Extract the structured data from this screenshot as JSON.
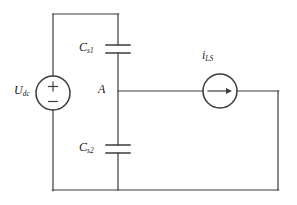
{
  "diagram": {
    "type": "electrical-schematic",
    "stroke_color": "#3b3b3b",
    "text_color": "#1a1a1a",
    "background_color": "#ffffff"
  },
  "components": {
    "voltage_source": {
      "name": "dc-voltage-source",
      "label_main": "U",
      "label_sub": "dc",
      "plus_sign": "+",
      "minus_sign": "−",
      "center_x": 53,
      "center_y": 93,
      "radius": 17
    },
    "capacitor_top": {
      "name": "capacitor-cs1",
      "label_main": "C",
      "label_sub": "s1",
      "plate_y_upper": 45,
      "plate_y_lower": 53,
      "plate_half_width": 12,
      "x": 118
    },
    "capacitor_bottom": {
      "name": "capacitor-cs2",
      "label_main": "C",
      "label_sub": "s2",
      "plate_y_upper": 145,
      "plate_y_lower": 153,
      "plate_half_width": 12,
      "x": 118
    },
    "current_source": {
      "name": "load-current-source",
      "label_main": "i",
      "label_sub": "LS",
      "center_x": 220,
      "center_y": 91,
      "radius": 17,
      "arrow_direction": "right"
    },
    "node_a": {
      "name": "node-a",
      "label": "A",
      "x": 118,
      "y": 91
    }
  },
  "wires": [
    {
      "name": "wire-top",
      "x1": 53,
      "y1": 14,
      "x2": 118,
      "y2": 14
    },
    {
      "name": "wire-left-upper",
      "x1": 53,
      "y1": 14,
      "x2": 53,
      "y2": 76
    },
    {
      "name": "wire-left-lower",
      "x1": 53,
      "y1": 110,
      "x2": 53,
      "y2": 190
    },
    {
      "name": "wire-mid-top",
      "x1": 118,
      "y1": 14,
      "x2": 118,
      "y2": 45
    },
    {
      "name": "wire-mid-cap1-node",
      "x1": 118,
      "y1": 53,
      "x2": 118,
      "y2": 145
    },
    {
      "name": "wire-mid-bottom",
      "x1": 118,
      "y1": 153,
      "x2": 118,
      "y2": 190
    },
    {
      "name": "wire-bottom",
      "x1": 53,
      "y1": 190,
      "x2": 278,
      "y2": 190
    },
    {
      "name": "wire-node-to-source",
      "x1": 118,
      "y1": 91,
      "x2": 203,
      "y2": 91
    },
    {
      "name": "wire-source-to-right",
      "x1": 237,
      "y1": 91,
      "x2": 278,
      "y2": 91
    },
    {
      "name": "wire-right",
      "x1": 278,
      "y1": 91,
      "x2": 278,
      "y2": 190
    }
  ]
}
